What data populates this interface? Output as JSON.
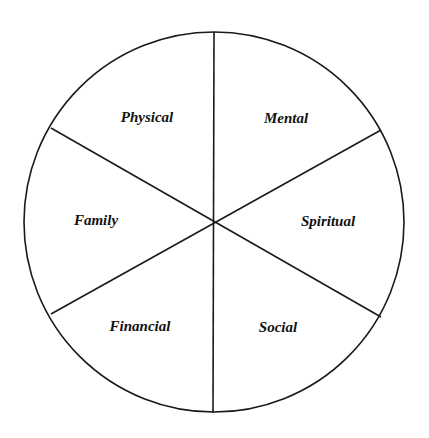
{
  "diagram": {
    "type": "wheel",
    "segments": [
      {
        "label": "Physical"
      },
      {
        "label": "Mental"
      },
      {
        "label": "Family"
      },
      {
        "label": "Spiritual"
      },
      {
        "label": "Financial"
      },
      {
        "label": "Social"
      }
    ],
    "colors": {
      "stroke": "#1a1a1a",
      "fill": "#ffffff",
      "text": "#111111"
    }
  }
}
